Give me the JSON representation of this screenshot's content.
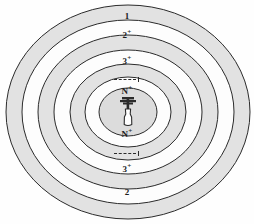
{
  "diagram": {
    "type": "concentric-zone",
    "title": "",
    "background_color": "#fefefe",
    "band_fill_color": "#e2e2e2",
    "gap_fill_color": "#fdfdfd",
    "core_fill_color": "#dcdcdc",
    "stroke_color": "#2b2b2b",
    "center": {
      "x": 128,
      "y": 112
    },
    "rings": [
      {
        "name": "zone-1",
        "rx": 122,
        "ry": 107,
        "fill": "#e2e2e2"
      },
      {
        "name": "zone-1-inner",
        "rx": 106,
        "ry": 92,
        "fill": "#fdfdfd"
      },
      {
        "name": "zone-2",
        "rx": 90,
        "ry": 77,
        "fill": "#e2e2e2"
      },
      {
        "name": "zone-2-inner",
        "rx": 74,
        "ry": 62,
        "fill": "#fdfdfd"
      },
      {
        "name": "zone-3",
        "rx": 58,
        "ry": 48,
        "fill": "#e2e2e2"
      },
      {
        "name": "zone-3-inner",
        "rx": 43,
        "ry": 35,
        "fill": "#fdfdfd"
      },
      {
        "name": "zone-core",
        "rx": 29,
        "ry": 24,
        "fill": "#dcdcdc"
      }
    ],
    "labels_top": [
      {
        "name": "zone-label-1-top",
        "text": "1",
        "sup": "",
        "y": 12
      },
      {
        "name": "zone-label-2-top",
        "text": "2",
        "sup": "+",
        "y": 30
      },
      {
        "name": "zone-label-3-top",
        "text": "3",
        "sup": "+",
        "y": 56
      },
      {
        "name": "zone-label-n-top",
        "text": "N",
        "sup": "+",
        "y": 86
      }
    ],
    "labels_bottom": [
      {
        "name": "zone-label-n-bottom",
        "text": "N",
        "sup": "+",
        "y": 128
      },
      {
        "name": "zone-label-3-bottom",
        "text": "3",
        "sup": "+",
        "y": 163
      },
      {
        "name": "zone-label-2-bottom",
        "text": "2",
        "sup": "",
        "y": 186
      }
    ],
    "dash_markers": [
      {
        "name": "dash-marker-top",
        "y": 74
      },
      {
        "name": "dash-marker-bottom",
        "y": 148
      }
    ],
    "center_icon": {
      "name": "transmitter-tower-icon",
      "label": "transmitter"
    }
  }
}
